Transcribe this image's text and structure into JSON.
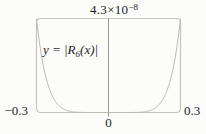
{
  "figure": {
    "background": "#fcfcfa",
    "text_color": "#1d1d1d",
    "box_color": "#c6c4bf",
    "axis_color": "#98968f",
    "curve_color": "#bdbab2"
  },
  "chart_data": {
    "type": "line",
    "equation": {
      "pre": "y = |R",
      "sub": "6",
      "post": "(x)|"
    },
    "y_max_label": {
      "mantissa": "4.3×10",
      "exponent": "−8"
    },
    "x_range": [
      -0.3,
      0.3
    ],
    "y_range": [
      0,
      4.3e-08
    ],
    "x_ticks": [
      {
        "x": -0.3,
        "label": "−0.3"
      },
      {
        "x": 0,
        "label": "0"
      },
      {
        "x": 0.3,
        "label": "0.3"
      }
    ],
    "grid": false,
    "legend": false,
    "curve": {
      "name": "remainder-magnitude",
      "power": 7,
      "edge_x": 0.3,
      "edge_y": 4.3e-08
    },
    "points": [
      {
        "x": -0.3,
        "y": 4.3e-08
      },
      {
        "x": -0.25,
        "y": 1.2e-08
      },
      {
        "x": -0.2,
        "y": 2.5e-09
      },
      {
        "x": -0.15,
        "y": 3.4e-10
      },
      {
        "x": -0.1,
        "y": 2e-11
      },
      {
        "x": -0.05,
        "y": 1.5e-13
      },
      {
        "x": 0.0,
        "y": 0
      },
      {
        "x": 0.05,
        "y": 1.5e-13
      },
      {
        "x": 0.1,
        "y": 2e-11
      },
      {
        "x": 0.15,
        "y": 3.4e-10
      },
      {
        "x": 0.2,
        "y": 2.5e-09
      },
      {
        "x": 0.25,
        "y": 1.2e-08
      },
      {
        "x": 0.3,
        "y": 4.3e-08
      }
    ]
  }
}
